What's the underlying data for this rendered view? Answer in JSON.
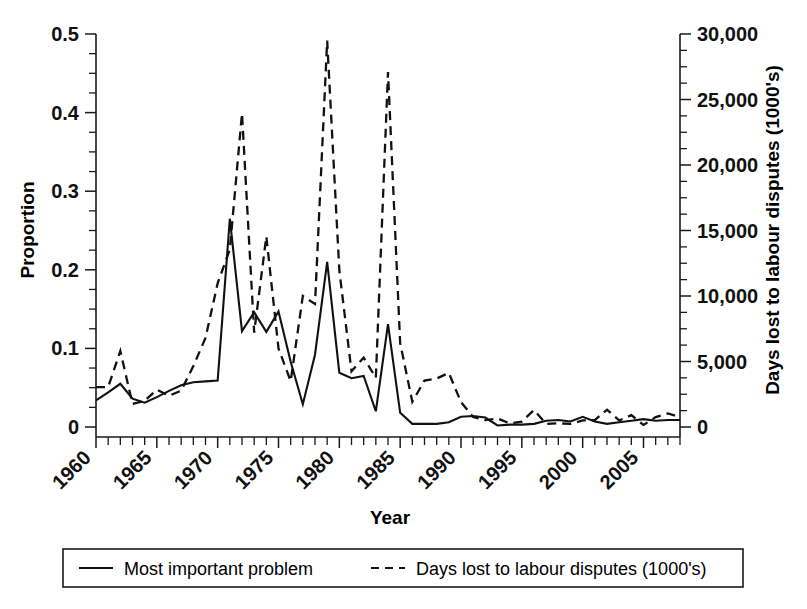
{
  "chart_data": {
    "type": "line",
    "title": "",
    "xlabel": "Year",
    "ylabel": "Proportion",
    "y2label": "Days lost to labour disputes (1000's)",
    "grid": false,
    "legend_position": "bottom",
    "xlim": [
      1960,
      2008
    ],
    "ylim": [
      0,
      0.5
    ],
    "y2lim": [
      0,
      30000
    ],
    "x_ticklabels": [
      "1960",
      "1965",
      "1970",
      "1975",
      "1980",
      "1985",
      "1990",
      "1995",
      "2000",
      "2005"
    ],
    "x_tickvalues": [
      1960,
      1965,
      1970,
      1975,
      1980,
      1985,
      1990,
      1995,
      2000,
      2005
    ],
    "x_minor_step": 1,
    "y_ticklabels": [
      "0",
      "0.1",
      "0.2",
      "0.3",
      "0.4",
      "0.5"
    ],
    "y_tickvalues": [
      0,
      0.1,
      0.2,
      0.3,
      0.4,
      0.5
    ],
    "y_minor_step": 0.025,
    "y2_ticklabels": [
      "0",
      "5,000",
      "10,000",
      "15,000",
      "20,000",
      "25,000",
      "30,000"
    ],
    "y2_tickvalues": [
      0,
      5000,
      10000,
      15000,
      20000,
      25000,
      30000
    ],
    "y2_minor_step": 1250,
    "x": [
      1960,
      1961,
      1962,
      1963,
      1964,
      1965,
      1966,
      1967,
      1968,
      1969,
      1970,
      1971,
      1972,
      1973,
      1974,
      1975,
      1976,
      1977,
      1978,
      1979,
      1980,
      1981,
      1982,
      1983,
      1984,
      1985,
      1986,
      1987,
      1988,
      1989,
      1990,
      1991,
      1992,
      1993,
      1994,
      1995,
      1996,
      1997,
      1998,
      1999,
      2000,
      2001,
      2002,
      2003,
      2004,
      2005,
      2006,
      2007,
      2008
    ],
    "series": [
      {
        "name": "Most important problem",
        "axis": "left",
        "style": "solid",
        "units": "proportion",
        "values": [
          0.034,
          0.044,
          0.055,
          0.036,
          0.031,
          0.038,
          0.046,
          0.053,
          0.057,
          0.058,
          0.059,
          0.265,
          0.122,
          0.146,
          0.121,
          0.147,
          0.083,
          0.029,
          0.092,
          0.21,
          0.069,
          0.062,
          0.065,
          0.02,
          0.131,
          0.018,
          0.004,
          0.004,
          0.004,
          0.006,
          0.013,
          0.014,
          0.012,
          0.002,
          0.003,
          0.003,
          0.004,
          0.008,
          0.009,
          0.007,
          0.013,
          0.007,
          0.004,
          0.006,
          0.008,
          0.01,
          0.008,
          0.009,
          0.009
        ]
      },
      {
        "name": "Days lost to labour disputes (1000's)",
        "axis": "right",
        "style": "dashed",
        "units": "thousand days",
        "values": [
          3050,
          3050,
          5800,
          1750,
          2000,
          2850,
          2380,
          2780,
          4650,
          6800,
          10980,
          13550,
          23950,
          7200,
          14550,
          6000,
          3500,
          10000,
          9400,
          29500,
          11960,
          4250,
          5300,
          3750,
          27100,
          6400,
          1920,
          3550,
          3700,
          4130,
          1900,
          760,
          530,
          650,
          280,
          415,
          1300,
          235,
          282,
          242,
          499,
          525,
          1323,
          499,
          905,
          158,
          755,
          1041,
          759
        ]
      }
    ]
  },
  "legend": {
    "items": [
      {
        "label": "Most important problem",
        "style": "solid"
      },
      {
        "label": "Days lost to labour disputes (1000's)",
        "style": "dashed"
      }
    ]
  }
}
